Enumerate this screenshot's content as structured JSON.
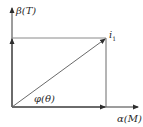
{
  "diagram": {
    "y_axis_label": "β(T)",
    "x_axis_label": "α(M)",
    "vector_label_main": "i",
    "vector_label_sub": "1",
    "angle_label": "φ(θ)",
    "colors": {
      "line": "#3a3a3a",
      "component_line": "#8a8a8a",
      "background": "#ffffff"
    }
  }
}
